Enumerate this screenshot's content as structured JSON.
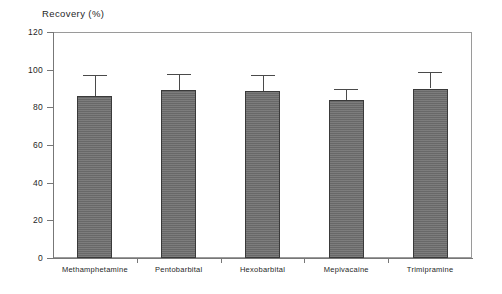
{
  "chart_data": {
    "type": "bar",
    "title": "Recovery (%)",
    "xlabel": "",
    "ylabel": "",
    "categories": [
      "Methamphetamine",
      "Pentobarbital",
      "Hexobarbital",
      "Mepivacaine",
      "Trimipramine"
    ],
    "values": [
      86,
      89,
      88.5,
      84,
      90
    ],
    "errors_upper": [
      11,
      8.5,
      8.5,
      6,
      8.5
    ],
    "ylim": [
      0,
      120
    ],
    "ytick_labels": [
      "0",
      "20",
      "40",
      "60",
      "80",
      "100",
      "120"
    ],
    "ytick_values": [
      0,
      20,
      40,
      60,
      80,
      100,
      120
    ],
    "grid": false,
    "legend": false,
    "bar_color": "#6e6e6e",
    "bar_edge_color": "#3a3a3a",
    "axis_color": "#777777",
    "error_bar_color": "#4a4a4a"
  }
}
